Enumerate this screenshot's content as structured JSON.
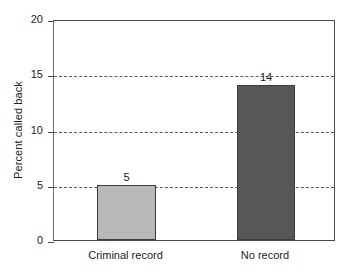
{
  "chart_data": {
    "type": "bar",
    "title": "",
    "xlabel": "",
    "ylabel": "Percent called back",
    "categories": [
      "Criminal record",
      "No record"
    ],
    "values": [
      5,
      14
    ],
    "value_labels": [
      "5",
      "14"
    ],
    "bar_colors": [
      "#b9b9b9",
      "#575757"
    ],
    "bar_edge_color": "#3d3d3d",
    "ylim": [
      0,
      20
    ],
    "yticks": [
      0,
      5,
      10,
      15,
      20
    ],
    "ytick_labels": [
      "0",
      "5",
      "10",
      "15",
      "20"
    ],
    "gridlines": {
      "horizontal_at": [
        5,
        10,
        15
      ],
      "style": "dashed",
      "color": "#3a3a3a"
    },
    "legend": null,
    "legend_position": "none",
    "axes": {
      "left_spine": true,
      "right_spine": true,
      "top_spine": true,
      "bottom_spine": true
    }
  },
  "axis": {
    "ylabel_text": "Percent called back"
  }
}
